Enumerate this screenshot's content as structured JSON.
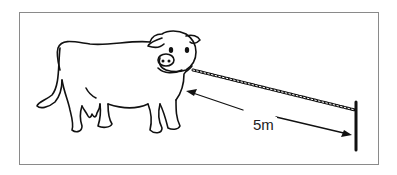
{
  "figure": {
    "measurement_label": "5m",
    "colors": {
      "line": "#111111",
      "frame": "#8a8a8a",
      "background": "#ffffff"
    }
  }
}
